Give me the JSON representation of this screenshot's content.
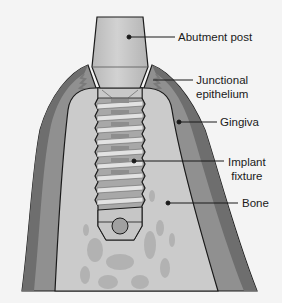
{
  "diagram": {
    "colors": {
      "background": "#f4f4f4",
      "gingiva": "#8f8f8f",
      "gingiva_dark": "#6f6f6f",
      "bone": "#c9c9c9",
      "bone_spots": "#b3b3b3",
      "abutment": "#c4c4c4",
      "implant_light": "#dcdcdc",
      "implant_dark": "#a6a6a6",
      "outline": "#1a1a1a"
    },
    "labels": [
      {
        "id": "abutment-post",
        "lines": [
          "Abutment post"
        ]
      },
      {
        "id": "junctional-epithelium",
        "lines": [
          "Junctional",
          "epithelium"
        ]
      },
      {
        "id": "gingiva",
        "lines": [
          "Gingiva"
        ]
      },
      {
        "id": "implant-fixture",
        "lines": [
          "Implant",
          "fixture"
        ]
      },
      {
        "id": "bone",
        "lines": [
          "Bone"
        ]
      }
    ]
  }
}
